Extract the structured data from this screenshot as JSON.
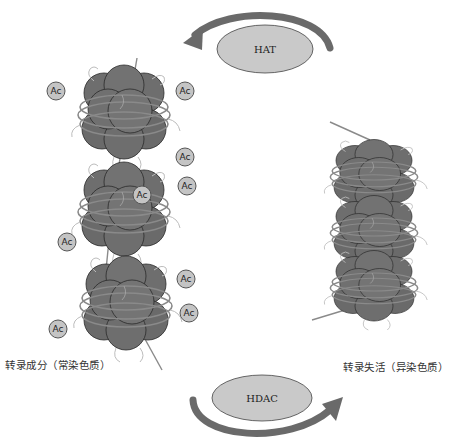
{
  "enzymes": {
    "top": {
      "label": "HAT",
      "arrow_direction": "counterclockwise-left"
    },
    "bottom": {
      "label": "HDAC",
      "arrow_direction": "clockwise-right"
    }
  },
  "states": {
    "left": {
      "label": "转录成分（常染色质）",
      "nucleosome_count": 3
    },
    "right": {
      "label": "转录失活（异染色质）",
      "nucleosome_count": 3
    }
  },
  "acetyl_group": {
    "label": "Ac",
    "count": 9
  },
  "colors": {
    "histone": "#6e6e6e",
    "histone_outline": "#2a2a2a",
    "dna": "#8a8a8a",
    "enzyme_fill": "#c9c9c9",
    "arrow": "#6a6a6a",
    "ac_fill": "#c4c4c4"
  }
}
